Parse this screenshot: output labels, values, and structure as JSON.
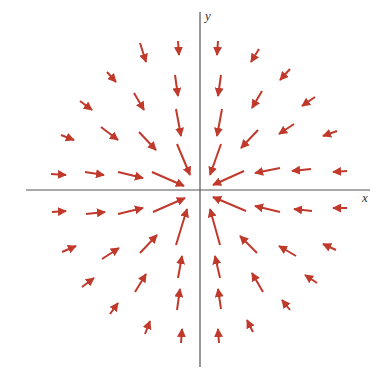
{
  "diagram": {
    "type": "vector_field",
    "axes": {
      "x_label": "x",
      "y_label": "y",
      "origin_px": [
        199,
        190
      ],
      "x_axis_px": [
        26,
        370
      ],
      "y_axis_px": [
        12,
        367
      ]
    },
    "arrow_color": "#c0392b",
    "axis_color": "#555555",
    "arrows": [
      [
        178,
        41,
        179,
        55
      ],
      [
        218,
        41,
        217,
        55
      ],
      [
        175,
        75,
        178,
        96
      ],
      [
        221,
        75,
        218,
        96
      ],
      [
        176,
        109,
        181,
        136
      ],
      [
        222,
        109,
        217,
        136
      ],
      [
        177,
        144,
        190,
        175
      ],
      [
        221,
        144,
        210,
        175
      ],
      [
        140,
        43,
        146,
        62
      ],
      [
        259,
        49,
        251,
        62
      ],
      [
        107,
        72,
        116,
        82
      ],
      [
        290,
        69,
        280,
        80
      ],
      [
        134,
        93,
        144,
        110
      ],
      [
        262,
        91,
        252,
        108
      ],
      [
        80,
        101,
        92,
        110
      ],
      [
        315,
        97,
        302,
        106
      ],
      [
        101,
        127,
        118,
        140
      ],
      [
        294,
        124,
        279,
        134
      ],
      [
        139,
        132,
        156,
        150
      ],
      [
        258,
        130,
        241,
        148
      ],
      [
        61,
        135,
        74,
        140
      ],
      [
        337,
        131,
        323,
        136
      ],
      [
        51,
        174,
        66,
        175
      ],
      [
        347,
        171,
        333,
        172
      ],
      [
        85,
        172,
        104,
        175
      ],
      [
        311,
        169,
        292,
        171
      ],
      [
        118,
        172,
        143,
        178
      ],
      [
        280,
        168,
        255,
        173
      ],
      [
        152,
        172,
        184,
        186
      ],
      [
        244,
        171,
        213,
        185
      ],
      [
        52,
        212,
        66,
        211
      ],
      [
        347,
        208,
        333,
        208
      ],
      [
        86,
        214,
        105,
        212
      ],
      [
        312,
        211,
        294,
        209
      ],
      [
        118,
        214,
        143,
        208
      ],
      [
        280,
        212,
        255,
        206
      ],
      [
        153,
        212,
        185,
        198
      ],
      [
        246,
        211,
        213,
        197
      ],
      [
        62,
        252,
        76,
        246
      ],
      [
        336,
        250,
        323,
        244
      ],
      [
        102,
        259,
        119,
        248
      ],
      [
        296,
        256,
        279,
        246
      ],
      [
        140,
        253,
        157,
        235
      ],
      [
        257,
        253,
        240,
        236
      ],
      [
        82,
        287,
        94,
        278
      ],
      [
        317,
        283,
        305,
        275
      ],
      [
        135,
        292,
        146,
        274
      ],
      [
        263,
        292,
        252,
        273
      ],
      [
        176,
        245,
        187,
        209
      ],
      [
        220,
        245,
        210,
        209
      ],
      [
        110,
        314,
        118,
        303
      ],
      [
        290,
        310,
        282,
        300
      ],
      [
        145,
        334,
        150,
        321
      ],
      [
        253,
        332,
        247,
        320
      ],
      [
        178,
        278,
        182,
        256
      ],
      [
        220,
        278,
        215,
        256
      ],
      [
        177,
        310,
        180,
        289
      ],
      [
        221,
        309,
        218,
        289
      ],
      [
        181,
        343,
        182,
        329
      ],
      [
        219,
        343,
        218,
        329
      ]
    ]
  }
}
